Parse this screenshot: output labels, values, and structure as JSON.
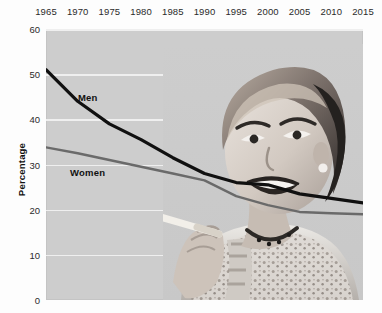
{
  "chart_data": {
    "type": "line",
    "title": "",
    "xlabel": "",
    "ylabel": "Percentage",
    "xlim": [
      1965,
      2015
    ],
    "ylim": [
      0,
      60
    ],
    "grid": true,
    "legend_position": "inline-labels",
    "xticks": [
      "1965",
      "1970",
      "1975",
      "1980",
      "1985",
      "1990",
      "1995",
      "2000",
      "2005",
      "2010",
      "2015"
    ],
    "yticks": [
      "0",
      "10",
      "20",
      "30",
      "40",
      "50",
      "60"
    ],
    "x": [
      1965,
      1970,
      1975,
      1980,
      1985,
      1990,
      1995,
      2000,
      2005,
      2010,
      2015
    ],
    "series": [
      {
        "name": "Men",
        "color": "#101010",
        "width": 3.2,
        "values": [
          51.0,
          44.0,
          39.0,
          35.5,
          31.5,
          28.0,
          26.0,
          25.5,
          23.5,
          22.5,
          21.5
        ]
      },
      {
        "name": "Women",
        "color": "#6a6a6a",
        "width": 2.4,
        "values": [
          33.8,
          32.5,
          31.0,
          29.5,
          28.0,
          26.5,
          23.0,
          21.0,
          19.5,
          19.2,
          19.0
        ]
      }
    ],
    "annotations": [
      {
        "text": "Men",
        "x_px": 78,
        "y_px": 92
      },
      {
        "text": "Women",
        "x_px": 70,
        "y_px": 167
      }
    ],
    "image_overlay": {
      "alt": "vintage black and white photo of a smiling woman holding a cigarette",
      "position": "right"
    }
  }
}
